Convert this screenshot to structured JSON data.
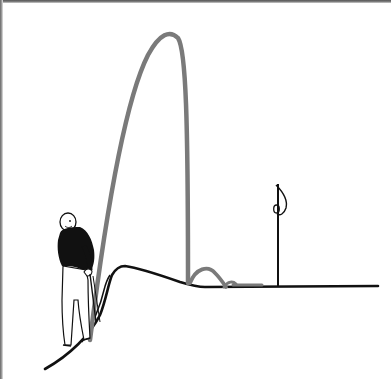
{
  "illustration": {
    "subject": "golfer hitting a high lob shot over a mound onto a flat green with a flagstick",
    "colors": {
      "background": "#ffffff",
      "ink": "#111111",
      "ball_path": "#7a7a7a",
      "shirt": "#111111",
      "trousers": "#ffffff"
    },
    "elements": {
      "golfer": "golfer-figure",
      "ball_trajectory": "ball-trajectory",
      "ground": "ground-line",
      "mound": "mound",
      "flagstick": "flagstick",
      "flag": "flag-icon"
    }
  }
}
